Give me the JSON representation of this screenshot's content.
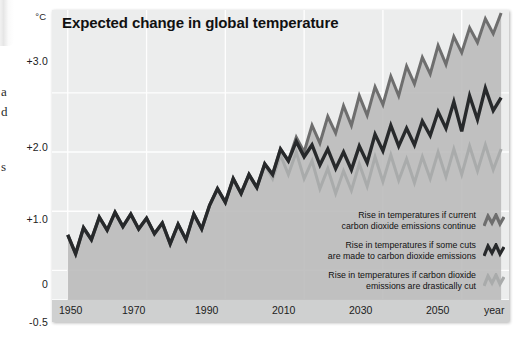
{
  "margin_artifacts": {
    "letters": [
      "a",
      "d",
      "s"
    ]
  },
  "axis": {
    "unit_label": "°C",
    "y_ticks": [
      "+3.0",
      "+2.0",
      "+1.0",
      "0",
      "-0.5"
    ],
    "x_ticks": [
      "1950",
      "1970",
      "1990",
      "2010",
      "2030",
      "2050"
    ],
    "x_axis_label": "year"
  },
  "title": "Expected change in global temperature",
  "legend": {
    "items": [
      {
        "line1": "Rise in temperatures if current",
        "line2": "carbon dioxide emissions continue",
        "icon": "zigzag-line-icon",
        "color": "#6e6e6e"
      },
      {
        "line1": "Rise in temperatures if some cuts",
        "line2": "are made to carbon dioxide emissions",
        "icon": "zigzag-line-icon",
        "color": "#27292b"
      },
      {
        "line1": "Rise in temperatures if carbon dioxide",
        "line2": "emissions are drastically cut",
        "icon": "zigzag-line-icon",
        "color": "#a9abab"
      }
    ]
  },
  "chart_data": {
    "type": "line",
    "title": "Expected change in global temperature",
    "xlabel": "year",
    "ylabel": "°C",
    "xlim": [
      1946,
      2062
    ],
    "ylim": [
      -0.5,
      4.4
    ],
    "grid": true,
    "yticks": [
      3.0,
      2.0,
      1.0,
      0.0,
      -0.5
    ],
    "xticks": [
      1950,
      1970,
      1990,
      2010,
      2030,
      2050
    ],
    "legend_position": "bottom-right",
    "colors": {
      "high": "#6e6e6e",
      "medium": "#27292b",
      "low": "#a9abab",
      "area_fill": "#b9baba",
      "plot_background": "#eceded",
      "gridline": "#ffffff",
      "xband_background": "#cfd0d0"
    },
    "x": [
      1950,
      1952,
      1954,
      1956,
      1958,
      1960,
      1962,
      1964,
      1966,
      1968,
      1970,
      1972,
      1974,
      1976,
      1978,
      1980,
      1982,
      1984,
      1986,
      1988,
      1990,
      1992,
      1994,
      1996,
      1998,
      2000,
      2002,
      2004,
      2006,
      2008,
      2010,
      2012,
      2014,
      2016,
      2018,
      2020,
      2022,
      2024,
      2026,
      2028,
      2030,
      2032,
      2034,
      2036,
      2038,
      2040,
      2042,
      2044,
      2046,
      2048,
      2050,
      2052,
      2054,
      2056,
      2058,
      2060
    ],
    "series": [
      {
        "name": "Rise in temperatures if current carbon dioxide emissions continue",
        "color": "#6e6e6e",
        "values": [
          0.6,
          0.28,
          0.72,
          0.52,
          0.9,
          0.68,
          0.98,
          0.74,
          0.95,
          0.7,
          0.88,
          0.62,
          0.8,
          0.45,
          0.78,
          0.52,
          0.95,
          0.7,
          1.1,
          1.38,
          1.15,
          1.55,
          1.3,
          1.62,
          1.4,
          1.8,
          1.62,
          2.05,
          1.85,
          2.25,
          2.0,
          2.45,
          2.15,
          2.6,
          2.32,
          2.78,
          2.45,
          2.95,
          2.62,
          3.1,
          2.8,
          3.28,
          2.95,
          3.45,
          3.15,
          3.6,
          3.32,
          3.8,
          3.48,
          3.95,
          3.68,
          4.1,
          3.85,
          4.25,
          4.0,
          4.35
        ]
      },
      {
        "name": "Rise in temperatures if some cuts are made to carbon dioxide emissions",
        "color": "#27292b",
        "values": [
          0.6,
          0.28,
          0.72,
          0.52,
          0.9,
          0.68,
          0.98,
          0.74,
          0.95,
          0.7,
          0.88,
          0.62,
          0.8,
          0.45,
          0.78,
          0.52,
          0.95,
          0.7,
          1.1,
          1.38,
          1.15,
          1.55,
          1.3,
          1.62,
          1.4,
          1.8,
          1.62,
          2.05,
          1.85,
          2.18,
          1.92,
          2.12,
          1.78,
          2.05,
          1.72,
          2.0,
          1.7,
          2.1,
          1.82,
          2.3,
          2.02,
          2.45,
          2.1,
          2.4,
          2.12,
          2.52,
          2.28,
          2.68,
          2.4,
          2.85,
          2.35,
          2.95,
          2.55,
          3.08,
          2.7,
          2.92
        ]
      },
      {
        "name": "Rise in temperatures if carbon dioxide emissions are drastically cut",
        "color": "#a9abab",
        "values": [
          0.6,
          0.28,
          0.72,
          0.52,
          0.9,
          0.68,
          0.98,
          0.74,
          0.95,
          0.7,
          0.88,
          0.62,
          0.8,
          0.45,
          0.78,
          0.52,
          0.95,
          0.7,
          1.1,
          1.38,
          1.15,
          1.55,
          1.3,
          1.62,
          1.4,
          1.8,
          1.55,
          1.95,
          1.62,
          2.0,
          1.55,
          1.85,
          1.38,
          1.72,
          1.3,
          1.68,
          1.35,
          1.8,
          1.42,
          1.92,
          1.5,
          1.95,
          1.52,
          1.88,
          1.48,
          1.92,
          1.55,
          2.0,
          1.58,
          2.05,
          1.62,
          2.1,
          1.68,
          2.12,
          1.7,
          2.05
        ]
      }
    ]
  }
}
